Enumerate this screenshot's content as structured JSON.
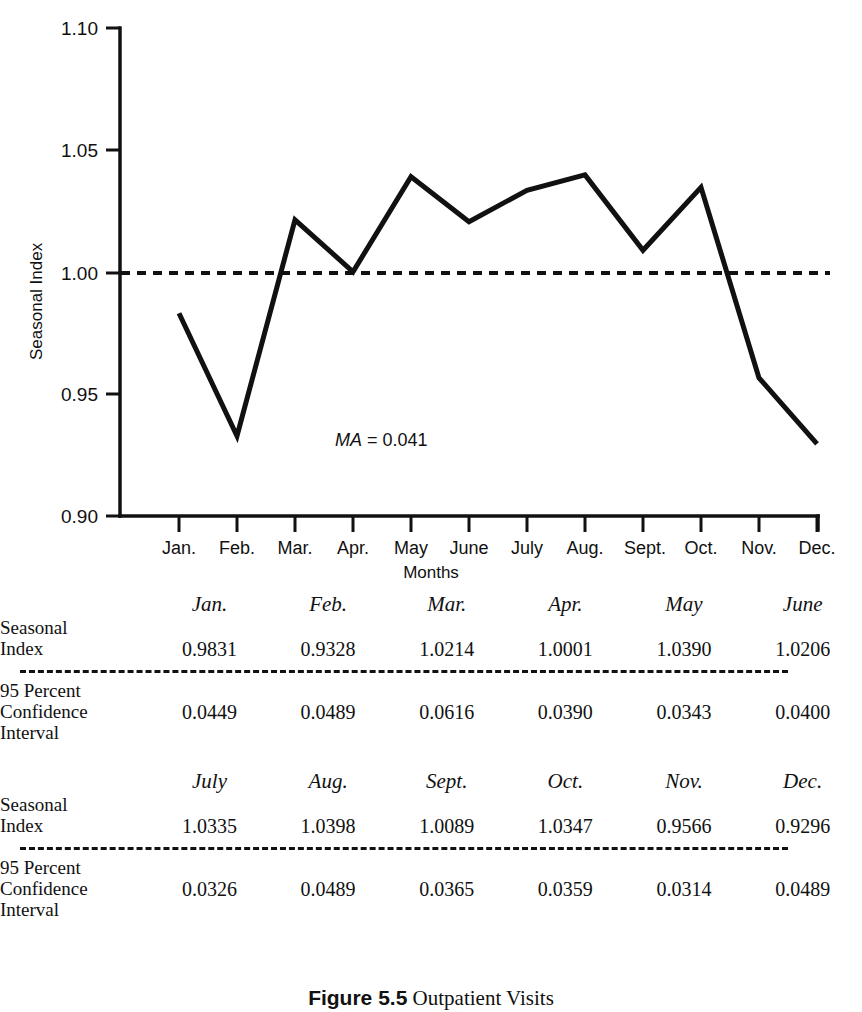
{
  "chart_data": {
    "type": "line",
    "title": "",
    "xlabel": "Months",
    "ylabel": "Seasonal Index",
    "categories": [
      "Jan.",
      "Feb.",
      "Mar.",
      "Apr.",
      "May",
      "June",
      "July",
      "Aug.",
      "Sept.",
      "Oct.",
      "Nov.",
      "Dec."
    ],
    "values": [
      0.9831,
      0.9328,
      1.0214,
      1.0001,
      1.039,
      1.0206,
      1.0335,
      1.0398,
      1.0089,
      1.0347,
      0.9566,
      0.9296
    ],
    "series": [
      {
        "name": "Seasonal Index",
        "values": [
          0.9831,
          0.9328,
          1.0214,
          1.0001,
          1.039,
          1.0206,
          1.0335,
          1.0398,
          1.0089,
          1.0347,
          0.9566,
          0.9296
        ]
      }
    ],
    "reference_line": {
      "value": 1.0,
      "style": "dashed",
      "label": ""
    },
    "ylim": [
      0.9,
      1.1
    ],
    "ytick_labels": [
      "1.10",
      "1.05",
      "1.00",
      "0.95",
      "0.90"
    ],
    "ytick_values": [
      1.1,
      1.05,
      1.0,
      0.95,
      0.9
    ],
    "grid": false,
    "legend": "none",
    "annotations": [
      {
        "text_italic": "MA",
        "text_rest": " = 0.041",
        "full": "MA = 0.041"
      }
    ]
  },
  "chart": {
    "y_axis_label": "Seasonal Index",
    "x_axis_label": "Months",
    "y_ticks": [
      "1.10",
      "1.05",
      "1.00",
      "0.95",
      "0.90"
    ],
    "x_ticks": [
      "Jan.",
      "Feb.",
      "Mar.",
      "Apr.",
      "May",
      "June",
      "July",
      "Aug.",
      "Sept.",
      "Oct.",
      "Nov.",
      "Dec."
    ],
    "annotation_ma_label": "MA",
    "annotation_ma_value": " = 0.041",
    "line_color": "#111111",
    "reference_line_color": "#111111"
  },
  "tables": [
    {
      "headers": [
        "Jan.",
        "Feb.",
        "Mar.",
        "Apr.",
        "May",
        "June"
      ],
      "rows": [
        {
          "label": "Seasonal\nIndex",
          "values": [
            "0.9831",
            "0.9328",
            "1.0214",
            "1.0001",
            "1.0390",
            "1.0206"
          ]
        },
        {
          "label": "95 Percent\nConfidence\nInterval",
          "values": [
            "0.0449",
            "0.0489",
            "0.0616",
            "0.0390",
            "0.0343",
            "0.0400"
          ]
        }
      ]
    },
    {
      "headers": [
        "July",
        "Aug.",
        "Sept.",
        "Oct.",
        "Nov.",
        "Dec."
      ],
      "rows": [
        {
          "label": "Seasonal\nIndex",
          "values": [
            "1.0335",
            "1.0398",
            "1.0089",
            "1.0347",
            "0.9566",
            "0.9296"
          ]
        },
        {
          "label": "95 Percent\nConfidence\nInterval",
          "values": [
            "0.0326",
            "0.0489",
            "0.0365",
            "0.0359",
            "0.0314",
            "0.0489"
          ]
        }
      ]
    }
  ],
  "caption": {
    "number": "Figure 5.5",
    "text": "Outpatient Visits"
  }
}
